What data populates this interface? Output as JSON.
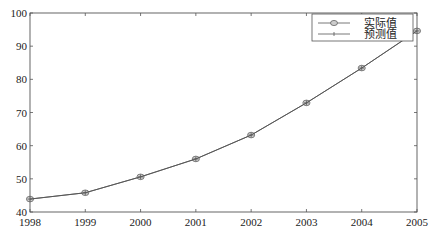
{
  "chart_data": {
    "type": "line",
    "title": "",
    "xlabel": "",
    "ylabel": "",
    "x": [
      1998,
      1999,
      2000,
      2001,
      2002,
      2003,
      2004,
      2005
    ],
    "categories": [
      "1998",
      "1999",
      "2000",
      "2001",
      "2002",
      "2003",
      "2004",
      "2005"
    ],
    "series": [
      {
        "name": "实际值",
        "marker": "circle",
        "values": [
          43.9,
          45.8,
          50.6,
          56.0,
          63.2,
          72.9,
          83.4,
          94.6
        ]
      },
      {
        "name": "预测值",
        "marker": "plus",
        "values": [
          43.9,
          45.8,
          50.6,
          56.0,
          63.2,
          72.9,
          83.4,
          94.6
        ]
      }
    ],
    "xlim": [
      1998,
      2005
    ],
    "ylim": [
      40,
      100
    ],
    "yticks": [
      40,
      50,
      60,
      70,
      80,
      90,
      100
    ],
    "xticks": [
      1998,
      1999,
      2000,
      2001,
      2002,
      2003,
      2004,
      2005
    ],
    "grid": false,
    "legend_position": "upper right",
    "colors": {
      "line": "#555555",
      "axis": "#555555",
      "marker_fill": "#bbbbbb"
    }
  },
  "legend": {
    "actual_label": "实际值",
    "predicted_label": "预测值"
  }
}
